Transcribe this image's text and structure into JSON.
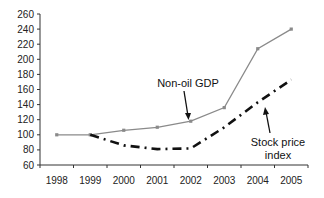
{
  "chart_data": {
    "type": "line",
    "title": "",
    "xlabel": "",
    "ylabel": "",
    "categories": [
      "1998",
      "1999",
      "2000",
      "2001",
      "2002",
      "2003",
      "2004",
      "2005"
    ],
    "ylim": [
      60,
      260
    ],
    "yticks": [
      60,
      80,
      100,
      120,
      140,
      160,
      180,
      200,
      220,
      240,
      260
    ],
    "grid": false,
    "legend": "none (inline annotations with arrows)",
    "series": [
      {
        "name": "Non-oil GDP",
        "style": "solid gray line with small square markers",
        "color": "#8a8a8a",
        "values": [
          100,
          100,
          106,
          110,
          118,
          136,
          214,
          240
        ]
      },
      {
        "name": "Stock price index",
        "style": "black dash-dot line",
        "color": "#111111",
        "values": [
          null,
          100,
          86,
          81,
          82,
          110,
          143,
          173
        ]
      }
    ],
    "annotations": [
      {
        "text": "Non-oil GDP",
        "points_to": "2002"
      },
      {
        "text": "Stock price index",
        "points_to": "2004"
      }
    ]
  },
  "labels": {
    "gdp_annotation": "Non-oil GDP",
    "stock_annotation_line1": "Stock price",
    "stock_annotation_line2": "index"
  }
}
